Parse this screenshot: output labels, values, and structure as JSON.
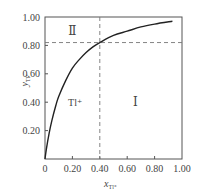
{
  "chart_data": {
    "type": "line",
    "title": "",
    "xlabel": "x_Tl+",
    "ylabel": "y_Tl+",
    "xlabel_main": "x",
    "xlabel_sub": "Tl⁺",
    "ylabel_main": "y",
    "ylabel_sub": "Tl⁺",
    "xlim": [
      0,
      1.0
    ],
    "ylim": [
      0,
      1.0
    ],
    "grid": false,
    "legend": null,
    "x_ticks": [
      "0",
      "0.20",
      "0.40",
      "0.60",
      "0.80",
      "1.00"
    ],
    "y_ticks": [
      "0.20",
      "0.40",
      "0.60",
      "0.80",
      "1.00"
    ],
    "series": [
      {
        "name": "Tl+ isotherm",
        "x": [
          0,
          0.01,
          0.03,
          0.05,
          0.08,
          0.1,
          0.15,
          0.2,
          0.25,
          0.3,
          0.35,
          0.4,
          0.5,
          0.6,
          0.7,
          0.8,
          0.93
        ],
        "y": [
          0,
          0.07,
          0.18,
          0.27,
          0.38,
          0.44,
          0.55,
          0.64,
          0.7,
          0.75,
          0.79,
          0.82,
          0.87,
          0.9,
          0.93,
          0.95,
          0.97
        ]
      }
    ],
    "reference_lines": [
      {
        "orientation": "vertical",
        "x": 0.4,
        "style": "dashed"
      },
      {
        "orientation": "horizontal",
        "y": 0.82,
        "style": "dashed"
      }
    ],
    "annotations": [
      {
        "text": "Ⅱ",
        "x": 0.2,
        "y": 0.9
      },
      {
        "text": "Tl⁺",
        "x": 0.22,
        "y": 0.4
      },
      {
        "text": "Ⅰ",
        "x": 0.66,
        "y": 0.4
      }
    ]
  }
}
